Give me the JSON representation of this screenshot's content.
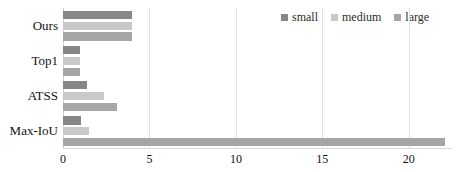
{
  "chart_data": {
    "type": "bar",
    "orientation": "horizontal",
    "title": "",
    "xlabel": "",
    "ylabel": "",
    "categories": [
      "Ours",
      "Top1",
      "ATSS",
      "Max-IoU"
    ],
    "series": [
      {
        "name": "small",
        "color": "#878787",
        "values": [
          4.0,
          1.0,
          1.4,
          1.05
        ]
      },
      {
        "name": "medium",
        "color": "#c9c9c9",
        "values": [
          4.0,
          1.0,
          2.4,
          1.5
        ]
      },
      {
        "name": "large",
        "color": "#a6a6a6",
        "values": [
          4.0,
          1.0,
          3.1,
          22.1
        ]
      }
    ],
    "xlim": [
      0,
      22.5
    ],
    "xticks": [
      0,
      5,
      10,
      15,
      20
    ],
    "xtick_labels": [
      "0",
      "5",
      "10",
      "15",
      "20"
    ],
    "grid": true,
    "grid_axis": "x",
    "legend_position": "top-right",
    "legend_entries": [
      "small",
      "medium",
      "large"
    ]
  }
}
